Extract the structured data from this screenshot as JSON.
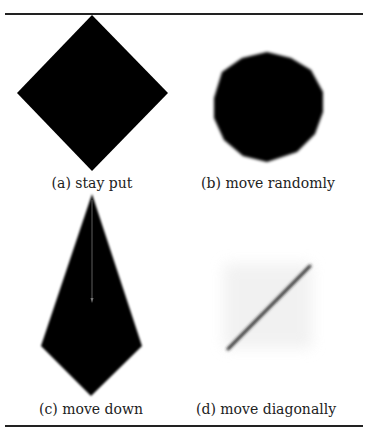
{
  "figure": {
    "panels": [
      {
        "id": "a",
        "caption": "(a) stay put",
        "shape": "diamond"
      },
      {
        "id": "b",
        "caption": "(b) move randomly",
        "shape": "blurred-octagon"
      },
      {
        "id": "c",
        "caption": "(c) move down",
        "shape": "elongated-kite-with-arrow"
      },
      {
        "id": "d",
        "caption": "(d) move diagonally",
        "shape": "diagonal-streak"
      }
    ]
  }
}
